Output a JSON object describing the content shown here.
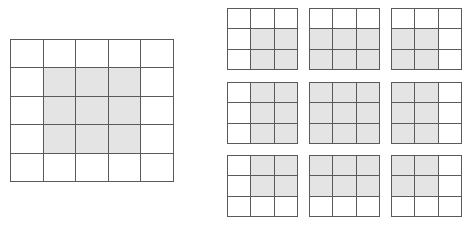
{
  "colors": {
    "shade": "#e4e4e4",
    "line": "#5a5a5a",
    "background": "#ffffff"
  },
  "main_grid": {
    "rows": 5,
    "cols": 5,
    "x": 10,
    "y": 39,
    "width": 164,
    "height": 143,
    "shaded": [
      [
        0,
        0,
        0,
        0,
        0
      ],
      [
        0,
        1,
        1,
        1,
        0
      ],
      [
        0,
        1,
        1,
        1,
        0
      ],
      [
        0,
        1,
        1,
        1,
        0
      ],
      [
        0,
        0,
        0,
        0,
        0
      ]
    ]
  },
  "sub_grids": [
    {
      "x": 227,
      "y": 8,
      "shaded": [
        [
          0,
          0,
          0
        ],
        [
          0,
          1,
          1
        ],
        [
          0,
          1,
          1
        ]
      ]
    },
    {
      "x": 309,
      "y": 8,
      "shaded": [
        [
          0,
          0,
          0
        ],
        [
          1,
          1,
          1
        ],
        [
          1,
          1,
          1
        ]
      ]
    },
    {
      "x": 391,
      "y": 8,
      "shaded": [
        [
          0,
          0,
          0
        ],
        [
          1,
          1,
          0
        ],
        [
          1,
          1,
          0
        ]
      ]
    },
    {
      "x": 227,
      "y": 82,
      "shaded": [
        [
          0,
          1,
          1
        ],
        [
          0,
          1,
          1
        ],
        [
          0,
          1,
          1
        ]
      ]
    },
    {
      "x": 309,
      "y": 82,
      "shaded": [
        [
          1,
          1,
          1
        ],
        [
          1,
          1,
          1
        ],
        [
          1,
          1,
          1
        ]
      ]
    },
    {
      "x": 391,
      "y": 82,
      "shaded": [
        [
          1,
          1,
          0
        ],
        [
          1,
          1,
          0
        ],
        [
          1,
          1,
          0
        ]
      ]
    },
    {
      "x": 227,
      "y": 155,
      "shaded": [
        [
          0,
          1,
          1
        ],
        [
          0,
          1,
          1
        ],
        [
          0,
          0,
          0
        ]
      ]
    },
    {
      "x": 309,
      "y": 155,
      "shaded": [
        [
          1,
          1,
          1
        ],
        [
          1,
          1,
          1
        ],
        [
          0,
          0,
          0
        ]
      ]
    },
    {
      "x": 391,
      "y": 155,
      "shaded": [
        [
          1,
          1,
          0
        ],
        [
          1,
          1,
          0
        ],
        [
          0,
          0,
          0
        ]
      ]
    }
  ],
  "sub_grid_size": {
    "width": 71,
    "height": 62
  }
}
